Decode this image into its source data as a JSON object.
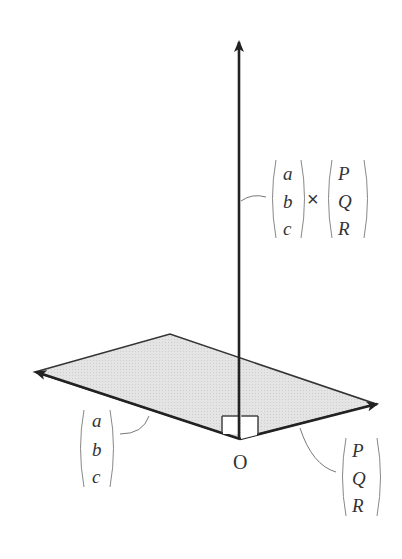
{
  "diagram": {
    "origin_label": "O",
    "normal_vector_label": {
      "left_vector": [
        "a",
        "b",
        "c"
      ],
      "operator": "×",
      "right_vector": [
        "P",
        "Q",
        "R"
      ]
    },
    "left_vector_label": [
      "a",
      "b",
      "c"
    ],
    "right_vector_label": [
      "P",
      "Q",
      "R"
    ],
    "colors": {
      "plane_fill": "#e6e6e6",
      "stroke": "#222222",
      "label": "#333333",
      "leader": "#777777"
    }
  }
}
